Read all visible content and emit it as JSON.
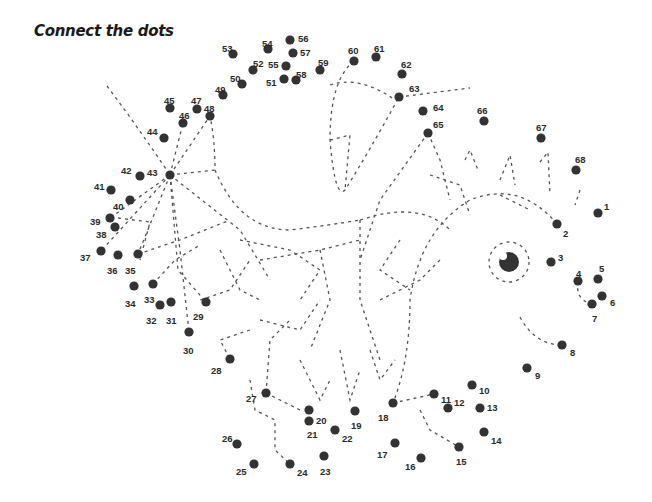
{
  "title": "Connect the dots",
  "colors": {
    "dot": "#333333",
    "dash": "#555555",
    "label": "#2b2b2b"
  },
  "eye": {
    "cx": 509,
    "cy": 262,
    "r": 10,
    "ring_r": 20
  },
  "dots": [
    {
      "n": "1",
      "x": 598,
      "y": 213,
      "lx": 604,
      "ly": 206
    },
    {
      "n": "2",
      "x": 557,
      "y": 224,
      "lx": 563,
      "ly": 233
    },
    {
      "n": "3",
      "x": 551,
      "y": 262,
      "lx": 558,
      "ly": 257
    },
    {
      "n": "4",
      "x": 578,
      "y": 281,
      "lx": 576,
      "ly": 273
    },
    {
      "n": "5",
      "x": 598,
      "y": 279,
      "lx": 599,
      "ly": 268
    },
    {
      "n": "6",
      "x": 602,
      "y": 296,
      "lx": 610,
      "ly": 302
    },
    {
      "n": "7",
      "x": 592,
      "y": 304,
      "lx": 592,
      "ly": 318
    },
    {
      "n": "8",
      "x": 562,
      "y": 345,
      "lx": 570,
      "ly": 352
    },
    {
      "n": "9",
      "x": 527,
      "y": 368,
      "lx": 535,
      "ly": 375
    },
    {
      "n": "10",
      "x": 472,
      "y": 385,
      "lx": 479,
      "ly": 390
    },
    {
      "n": "11",
      "x": 434,
      "y": 394,
      "lx": 441,
      "ly": 399
    },
    {
      "n": "12",
      "x": 448,
      "y": 408,
      "lx": 454,
      "ly": 402
    },
    {
      "n": "13",
      "x": 480,
      "y": 408,
      "lx": 487,
      "ly": 407
    },
    {
      "n": "14",
      "x": 484,
      "y": 432,
      "lx": 491,
      "ly": 440
    },
    {
      "n": "15",
      "x": 459,
      "y": 447,
      "lx": 456,
      "ly": 461
    },
    {
      "n": "16",
      "x": 421,
      "y": 458,
      "lx": 405,
      "ly": 466
    },
    {
      "n": "17",
      "x": 395,
      "y": 443,
      "lx": 377,
      "ly": 454
    },
    {
      "n": "18",
      "x": 393,
      "y": 403,
      "lx": 378,
      "ly": 417
    },
    {
      "n": "19",
      "x": 355,
      "y": 411,
      "lx": 351,
      "ly": 425
    },
    {
      "n": "20",
      "x": 309,
      "y": 410,
      "lx": 316,
      "ly": 420
    },
    {
      "n": "21",
      "x": 309,
      "y": 421,
      "lx": 307,
      "ly": 434
    },
    {
      "n": "22",
      "x": 335,
      "y": 430,
      "lx": 342,
      "ly": 438
    },
    {
      "n": "23",
      "x": 324,
      "y": 456,
      "lx": 320,
      "ly": 471
    },
    {
      "n": "24",
      "x": 290,
      "y": 464,
      "lx": 297,
      "ly": 472
    },
    {
      "n": "25",
      "x": 254,
      "y": 464,
      "lx": 236,
      "ly": 471
    },
    {
      "n": "26",
      "x": 237,
      "y": 444,
      "lx": 222,
      "ly": 438
    },
    {
      "n": "27",
      "x": 266,
      "y": 393,
      "lx": 246,
      "ly": 398
    },
    {
      "n": "28",
      "x": 230,
      "y": 359,
      "lx": 211,
      "ly": 370
    },
    {
      "n": "29",
      "x": 206,
      "y": 302,
      "lx": 193,
      "ly": 316
    },
    {
      "n": "30",
      "x": 189,
      "y": 332,
      "lx": 183,
      "ly": 350
    },
    {
      "n": "31",
      "x": 171,
      "y": 302,
      "lx": 166,
      "ly": 320
    },
    {
      "n": "32",
      "x": 160,
      "y": 305,
      "lx": 146,
      "ly": 320
    },
    {
      "n": "33",
      "x": 153,
      "y": 284,
      "lx": 144,
      "ly": 299
    },
    {
      "n": "34",
      "x": 134,
      "y": 286,
      "lx": 125,
      "ly": 303
    },
    {
      "n": "35",
      "x": 138,
      "y": 254,
      "lx": 125,
      "ly": 270
    },
    {
      "n": "36",
      "x": 118,
      "y": 255,
      "lx": 107,
      "ly": 270
    },
    {
      "n": "37",
      "x": 101,
      "y": 251,
      "lx": 80,
      "ly": 257
    },
    {
      "n": "38",
      "x": 115,
      "y": 227,
      "lx": 96,
      "ly": 234
    },
    {
      "n": "39",
      "x": 110,
      "y": 218,
      "lx": 90,
      "ly": 221
    },
    {
      "n": "40",
      "x": 130,
      "y": 200,
      "lx": 113,
      "ly": 206
    },
    {
      "n": "41",
      "x": 111,
      "y": 190,
      "lx": 94,
      "ly": 186
    },
    {
      "n": "42",
      "x": 140,
      "y": 176,
      "lx": 121,
      "ly": 170
    },
    {
      "n": "43",
      "x": 170,
      "y": 175,
      "lx": 147,
      "ly": 172
    },
    {
      "n": "44",
      "x": 164,
      "y": 138,
      "lx": 147,
      "ly": 131
    },
    {
      "n": "45",
      "x": 170,
      "y": 108,
      "lx": 164,
      "ly": 100
    },
    {
      "n": "46",
      "x": 183,
      "y": 123,
      "lx": 179,
      "ly": 115
    },
    {
      "n": "47",
      "x": 197,
      "y": 109,
      "lx": 191,
      "ly": 100
    },
    {
      "n": "48",
      "x": 210,
      "y": 116,
      "lx": 204,
      "ly": 108
    },
    {
      "n": "49",
      "x": 223,
      "y": 95,
      "lx": 215,
      "ly": 89
    },
    {
      "n": "50",
      "x": 242,
      "y": 84,
      "lx": 230,
      "ly": 78
    },
    {
      "n": "51",
      "x": 284,
      "y": 79,
      "lx": 266,
      "ly": 82
    },
    {
      "n": "52",
      "x": 253,
      "y": 70,
      "lx": 253,
      "ly": 63
    },
    {
      "n": "53",
      "x": 233,
      "y": 54,
      "lx": 222,
      "ly": 48
    },
    {
      "n": "54",
      "x": 268,
      "y": 49,
      "lx": 262,
      "ly": 43
    },
    {
      "n": "55",
      "x": 286,
      "y": 66,
      "lx": 268,
      "ly": 64
    },
    {
      "n": "56",
      "x": 290,
      "y": 40,
      "lx": 298,
      "ly": 38
    },
    {
      "n": "57",
      "x": 293,
      "y": 53,
      "lx": 300,
      "ly": 52
    },
    {
      "n": "58",
      "x": 296,
      "y": 80,
      "lx": 296,
      "ly": 74
    },
    {
      "n": "59",
      "x": 320,
      "y": 70,
      "lx": 318,
      "ly": 62
    },
    {
      "n": "60",
      "x": 354,
      "y": 61,
      "lx": 348,
      "ly": 50
    },
    {
      "n": "61",
      "x": 376,
      "y": 57,
      "lx": 374,
      "ly": 48
    },
    {
      "n": "62",
      "x": 402,
      "y": 74,
      "lx": 401,
      "ly": 64
    },
    {
      "n": "63",
      "x": 399,
      "y": 97,
      "lx": 409,
      "ly": 88
    },
    {
      "n": "64",
      "x": 423,
      "y": 111,
      "lx": 433,
      "ly": 107
    },
    {
      "n": "65",
      "x": 428,
      "y": 133,
      "lx": 433,
      "ly": 124
    },
    {
      "n": "66",
      "x": 484,
      "y": 121,
      "lx": 477,
      "ly": 110
    },
    {
      "n": "67",
      "x": 541,
      "y": 138,
      "lx": 536,
      "ly": 127
    },
    {
      "n": "68",
      "x": 576,
      "y": 170,
      "lx": 575,
      "ly": 159
    }
  ]
}
